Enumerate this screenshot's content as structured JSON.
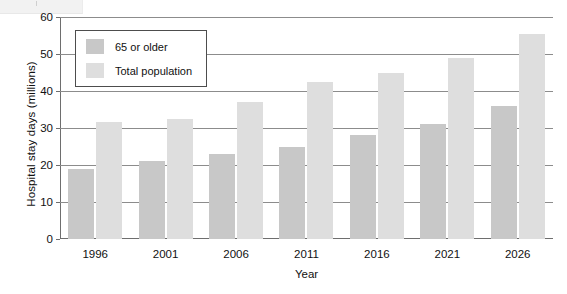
{
  "chart_data": {
    "type": "bar",
    "title": "",
    "xlabel": "Year",
    "ylabel": "Hospital stay days (millions)",
    "categories": [
      "1996",
      "2001",
      "2006",
      "2011",
      "2016",
      "2021",
      "2026"
    ],
    "series": [
      {
        "name": "65 or older",
        "color": "#c8c8c8",
        "values": [
          19,
          21,
          23,
          25,
          28,
          31,
          36
        ]
      },
      {
        "name": "Total population",
        "color": "#dedede",
        "values": [
          31.5,
          32.5,
          37,
          42.5,
          45,
          49,
          55.5
        ]
      }
    ],
    "ylim": [
      0,
      60
    ],
    "yticks": [
      0,
      10,
      20,
      30,
      40,
      50,
      60
    ],
    "ytick_labels": [
      "0",
      "10",
      "20",
      "30",
      "40",
      "50",
      "60"
    ],
    "grid": true,
    "legend_position": "upper-left-inside"
  },
  "legend": {
    "entries": [
      {
        "label": "65 or older"
      },
      {
        "label": "Total population"
      }
    ]
  }
}
